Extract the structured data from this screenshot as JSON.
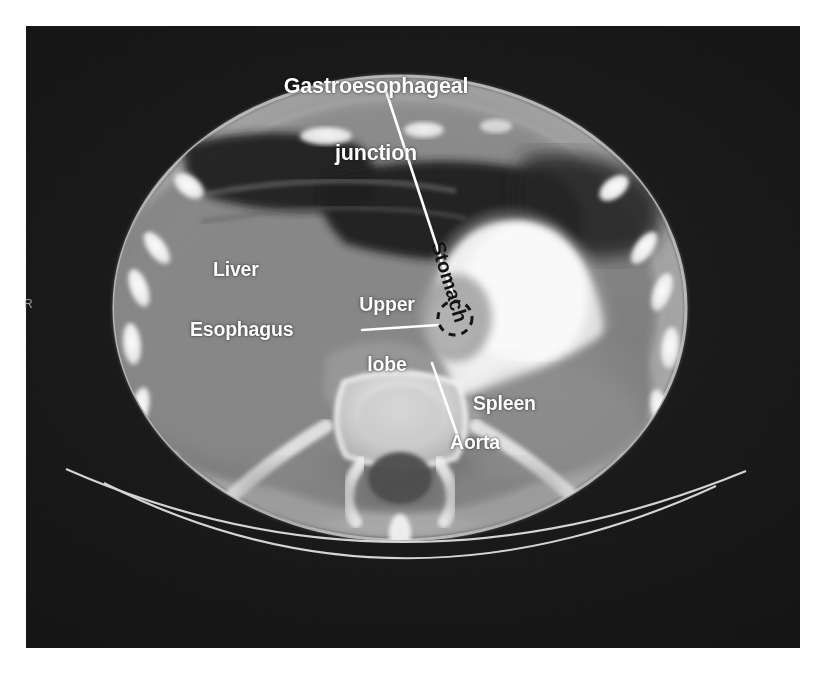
{
  "figure": {
    "kind": "axial-ct-upper-abdomen",
    "background_color": "#ffffff",
    "scan_background_color": "#141414",
    "label_color_white": "#ffffff",
    "label_color_black": "#121212",
    "leader_line_color": "#ffffff",
    "roi_circle_color": "#111111",
    "roi_circle_style": "dashed"
  },
  "orientation_marker": {
    "label": "R",
    "meaning": "right-side-marker"
  },
  "annotations": [
    {
      "id": "gastroesophageal-junction",
      "label_line_1": "Gastroesophageal",
      "label_line_2": "junction",
      "full_label": "Gastroesophageal junction",
      "color": "white",
      "has_leader_line": true,
      "has_roi_circle": true
    },
    {
      "id": "liver",
      "full_label": "Liver",
      "color": "white",
      "has_leader_line": false,
      "has_roi_circle": false
    },
    {
      "id": "upper-lobe",
      "label_line_1": "Upper",
      "label_line_2": "lobe",
      "full_label": "Upper lobe",
      "color": "white",
      "has_leader_line": false,
      "has_roi_circle": false
    },
    {
      "id": "esophagus",
      "full_label": "Esophagus",
      "color": "white",
      "has_leader_line": true,
      "has_roi_circle": false
    },
    {
      "id": "stomach",
      "full_label": "Stomach",
      "color": "black",
      "rotation_degrees": 73,
      "has_leader_line": false,
      "has_roi_circle": false
    },
    {
      "id": "spleen",
      "full_label": "Spleen",
      "color": "white",
      "has_leader_line": false,
      "has_roi_circle": false
    },
    {
      "id": "aorta",
      "full_label": "Aorta",
      "color": "white",
      "has_leader_line": true,
      "has_roi_circle": false
    }
  ],
  "labels": {
    "ge_junction_line1": "Gastroesophageal",
    "ge_junction_line2": "junction",
    "liver": "Liver",
    "upper_lobe_line1": "Upper",
    "upper_lobe_line2": "lobe",
    "esophagus": "Esophagus",
    "stomach": "Stomach",
    "spleen": "Spleen",
    "aorta": "Aorta",
    "orientation_r": "R"
  }
}
